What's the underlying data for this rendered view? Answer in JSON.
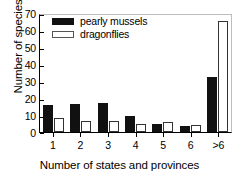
{
  "chart_data": {
    "type": "bar",
    "title": "",
    "subtitle": "",
    "xlabel": "Number of states and provinces",
    "ylabel": "Number of species (%)",
    "categories": [
      "1",
      "2",
      "3",
      "4",
      "5",
      "6",
      ">6"
    ],
    "series": [
      {
        "name": "pearly mussels",
        "color": "#111111",
        "fill": "solid-black",
        "values": [
          15.8,
          16.5,
          17.3,
          9.3,
          5.0,
          3.7,
          32.3
        ]
      },
      {
        "name": "dragonflies",
        "color": "#ffffff",
        "fill": "white-outlined",
        "values": [
          8.2,
          6.5,
          6.5,
          4.6,
          5.7,
          4.0,
          65.5
        ]
      }
    ],
    "ylim": [
      0,
      70
    ],
    "yticks": [
      0,
      10,
      20,
      30,
      40,
      50,
      60,
      70
    ],
    "ytick_labels": [
      "0",
      "10",
      "20",
      "30",
      "40",
      "50",
      "60",
      "70"
    ],
    "grid": false,
    "legend_position": "top-left",
    "axis_frame": "box",
    "bar_grouping": "grouped"
  }
}
